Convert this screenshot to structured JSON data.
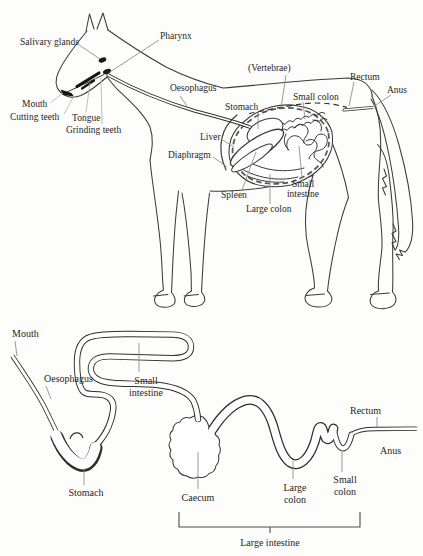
{
  "colors": {
    "ink": "#2f2f2f",
    "outline": "#3b3b3b",
    "leader": "#8f8f8f",
    "leader_light": "#b8b8b8",
    "text": "#262626",
    "background": "#fdfdfc"
  },
  "anatomy_figure": {
    "description": "Side view of horse with digestive organs labeled",
    "labels": {
      "salivary_glands": "Salivary glands",
      "pharynx": "Pharynx",
      "vertebrae": "(Vertebrae)",
      "rectum": "Rectum",
      "anus": "Anus",
      "oesophagus": "Oesophagus",
      "stomach": "Stomach",
      "small_colon": "Small colon",
      "mouth": "Mouth",
      "cutting_teeth": "Cutting teeth",
      "tongue": "Tongue",
      "grinding_teeth": "Grinding teeth",
      "liver": "Liver",
      "diaphragm": "Diaphragm",
      "spleen": "Spleen",
      "large_colon": "Large colon",
      "small_intestine_line1": "Small",
      "small_intestine_line2": "intestine"
    }
  },
  "schematic_figure": {
    "description": "Unrolled schematic of the horse digestive tract",
    "labels": {
      "mouth": "Mouth",
      "oesophagus": "Oesophagus",
      "small_intestine_line1": "Small",
      "small_intestine_line2": "intestine",
      "stomach": "Stomach",
      "caecum": "Caecum",
      "large_colon_line1": "Large",
      "large_colon_line2": "colon",
      "small_colon_line1": "Small",
      "small_colon_line2": "colon",
      "rectum": "Rectum",
      "anus": "Anus",
      "large_intestine": "Large intestine"
    }
  }
}
